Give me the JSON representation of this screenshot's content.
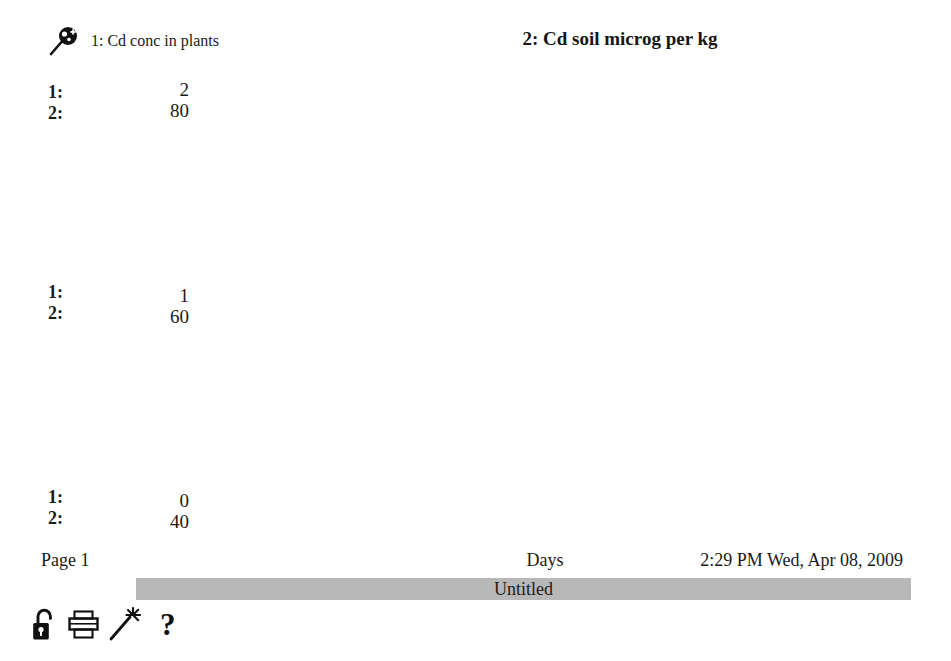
{
  "header": {
    "series1_icon": "magnifier-pin-icon",
    "series1_legend": "1: Cd conc in plants",
    "series2_legend": "2: Cd soil microg per kg"
  },
  "axis_scales": {
    "top": {
      "line1": "1:",
      "line2": "2:"
    },
    "middle": {
      "line1": "1:",
      "line2": "2:"
    },
    "bottom": {
      "line1": "1:",
      "line2": "2:"
    }
  },
  "y_ticks": {
    "top": {
      "series1": "2",
      "series2": "80"
    },
    "middle": {
      "series1": "1",
      "series2": "60"
    },
    "bottom": {
      "series1": "0",
      "series2": "40"
    }
  },
  "x_ticks": [
    "0.00",
    "200.00",
    "400.00",
    "600.00",
    "800.00",
    "1000.00"
  ],
  "footer": {
    "page": "Page 1",
    "xaxis_title": "Days",
    "timestamp": "2:29 PM Wed, Apr 08, 2009",
    "doc_title": "Untitled"
  },
  "toolbar": {
    "lock": "padlock-open-icon",
    "print": "printer-icon",
    "wand": "magic-wand-icon",
    "help": "?"
  },
  "colors": {
    "series1": "#b9b9b9",
    "series2": "#111111",
    "grid": "#3a3a3a",
    "title_bar": "#b8b8b8",
    "legend_gray": "#9a9a9a"
  },
  "chart_data": {
    "type": "line",
    "xlabel": "Days",
    "ylabel": "",
    "xlim": [
      0,
      1000
    ],
    "grid": true,
    "legend": "top",
    "axes": [
      {
        "id": 1,
        "name": "Cd conc in plants",
        "ylim": [
          0,
          2
        ],
        "ticks": [
          0,
          1,
          2
        ],
        "color": "#b9b9b9"
      },
      {
        "id": 2,
        "name": "Cd soil microg per kg",
        "ylim": [
          40,
          80
        ],
        "ticks": [
          40,
          60,
          80
        ],
        "color": "#111111"
      }
    ],
    "series": [
      {
        "name": "1: Cd conc in plants",
        "axis": 1,
        "color": "#b9b9b9",
        "label_marks": [
          {
            "x": 35,
            "y": 0.34
          },
          {
            "x": 330,
            "y": 0.03
          },
          {
            "x": 500,
            "y": 0.62
          },
          {
            "x": 730,
            "y": 0.03
          }
        ],
        "x": [
          0,
          185,
          190,
          372,
          545,
          552,
          723,
          905,
          912,
          1000
        ],
        "y": [
          0,
          1.78,
          0.0,
          0.0,
          1.45,
          0.0,
          0.0,
          1.3,
          0.0,
          0.0
        ]
      },
      {
        "name": "2: Cd soil microg per kg",
        "axis": 2,
        "color": "#111111",
        "label_marks": [
          {
            "x": 80,
            "y": 74.0
          },
          {
            "x": 280,
            "y": 71.4
          },
          {
            "x": 500,
            "y": 65.8
          },
          {
            "x": 670,
            "y": 59.2
          },
          {
            "x": 845,
            "y": 52.6
          }
        ],
        "x": [
          0,
          40,
          80,
          120,
          160,
          190,
          210,
          240,
          270,
          300,
          340,
          380,
          420,
          460,
          500,
          540,
          580,
          620,
          660,
          700,
          740,
          780,
          820,
          860,
          900,
          940,
          1000
        ],
        "y": [
          80.0,
          77.4,
          74.8,
          72.3,
          69.8,
          68.4,
          69.6,
          70.9,
          71.6,
          71.6,
          71.0,
          70.2,
          69.2,
          68.0,
          66.6,
          65.0,
          63.4,
          62.4,
          61.7,
          60.8,
          59.6,
          58.2,
          56.6,
          54.8,
          52.9,
          51.3,
          49.6
        ]
      }
    ]
  }
}
